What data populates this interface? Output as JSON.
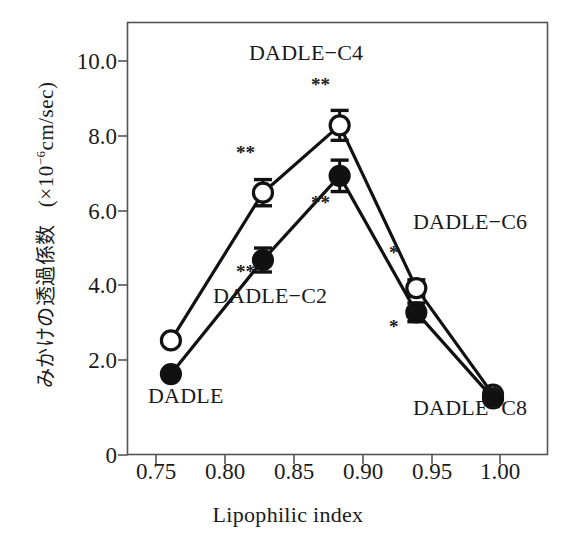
{
  "chart_data": {
    "type": "line",
    "title": "",
    "xlabel": "Lipophilic index",
    "ylabel": "みかけの透過係数　(×10⁻⁶cm/sec)",
    "ylabel_jp": "みかけの透過係数",
    "ylabel_units": "(×10⁻⁶cm/sec)",
    "xlim": [
      0.7417,
      1.0155
    ],
    "ylim": [
      0,
      11.55
    ],
    "grid": false,
    "legend": "none (series labeled in-plot)",
    "xticks": [
      "0.75",
      "0.80",
      "0.85",
      "0.90",
      "0.95",
      "1.00"
    ],
    "xtick_values": [
      0.75,
      0.8,
      0.85,
      0.9,
      0.95,
      1.0
    ],
    "yticks": [
      "0",
      "2.0",
      "4.0",
      "6.0",
      "8.0",
      "10.0"
    ],
    "ytick_values": [
      0,
      2.0,
      4.0,
      6.0,
      8.0,
      10.0
    ],
    "x": [
      0.77,
      0.83,
      0.88,
      0.93,
      0.98
    ],
    "point_labels": [
      "DADLE",
      "DADLE−C2",
      "DADLE−C4",
      "DADLE−C6",
      "DADLE−C8"
    ],
    "series": [
      {
        "name": "open-circle",
        "marker": "open circle",
        "values": [
          3.05,
          7.0,
          8.8,
          4.45,
          1.6
        ],
        "errors": [
          0,
          0.35,
          0.4,
          0.22,
          0
        ],
        "significance": [
          "",
          "**",
          "**",
          "*",
          "**"
        ]
      },
      {
        "name": "filled-circle",
        "marker": "filled circle",
        "values": [
          2.15,
          5.2,
          7.45,
          3.8,
          1.5
        ],
        "errors": [
          0,
          0.32,
          0.42,
          0.25,
          0
        ],
        "significance": [
          "",
          "**",
          "**",
          "*",
          ""
        ]
      }
    ]
  },
  "annotations": {
    "dadle": "DADLE",
    "dadle_c2": "DADLE−C2",
    "dadle_c4": "DADLE−C4",
    "dadle_c6": "DADLE−C6",
    "dadle_c8": "DADLE−C8",
    "sig_c2_open": "**",
    "sig_c2_filled": "**",
    "sig_c4_open": "**",
    "sig_c4_filled": "**",
    "sig_c6_open": "*",
    "sig_c6_filled": "*",
    "sig_c8_open": "**"
  },
  "colors": {
    "ink": "#1a1a1a",
    "axis": "#555555",
    "background": "#ffffff",
    "marker_fill": "#111111"
  }
}
